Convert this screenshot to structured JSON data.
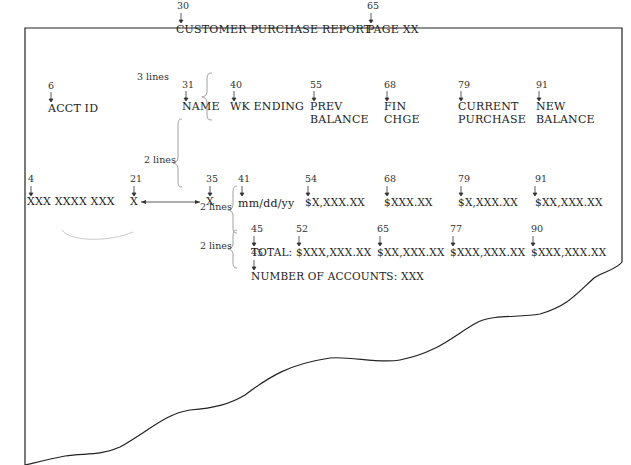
{
  "title": "CUSTOMER PURCHASE REPORT",
  "page_label": "PAGE XX",
  "spacing_labels": {
    "title_to_headings": "3 lines",
    "headings_to_detail": "2 lines",
    "detail_to_total": "2 lines",
    "total_to_count": "2 lines"
  },
  "title_line": [
    {
      "col": "30",
      "text": "CUSTOMER PURCHASE REPORT"
    },
    {
      "col": "65",
      "text": "PAGE XX"
    }
  ],
  "heading_line": [
    {
      "col": "6",
      "line1": "ACCT ID",
      "line2": ""
    },
    {
      "col": "31",
      "line1": "NAME",
      "line2": ""
    },
    {
      "col": "40",
      "line1": "WK ENDING",
      "line2": ""
    },
    {
      "col": "55",
      "line1": "PREV",
      "line2": "BALANCE"
    },
    {
      "col": "68",
      "line1": "FIN",
      "line2": "CHGE"
    },
    {
      "col": "79",
      "line1": "CURRENT",
      "line2": "PURCHASE"
    },
    {
      "col": "91",
      "line1": "NEW",
      "line2": "BALANCE"
    }
  ],
  "detail_line": [
    {
      "col": "4",
      "text": "XXX XXXX XXX"
    },
    {
      "col": "21",
      "text": "X"
    },
    {
      "col": "35",
      "text": "X"
    },
    {
      "col": "41",
      "text": "mm/dd/yy"
    },
    {
      "col": "54",
      "text": "$X,XXX.XX"
    },
    {
      "col": "68",
      "text": "$XXX.XX"
    },
    {
      "col": "79",
      "text": "$X,XXX.XX"
    },
    {
      "col": "91",
      "text": "$XX,XXX.XX"
    }
  ],
  "total_line": [
    {
      "col": "45",
      "text": "TOTAL:"
    },
    {
      "col": "52",
      "text": "$XXX,XXX.XX"
    },
    {
      "col": "65",
      "text": "$XX,XXX.XX"
    },
    {
      "col": "77",
      "text": "$XXX,XXX.XX"
    },
    {
      "col": "90",
      "text": "$XXX,XXX.XX"
    }
  ],
  "count_line": [
    {
      "col": "45",
      "text": "NUMBER OF ACCOUNTS: XXX"
    }
  ]
}
